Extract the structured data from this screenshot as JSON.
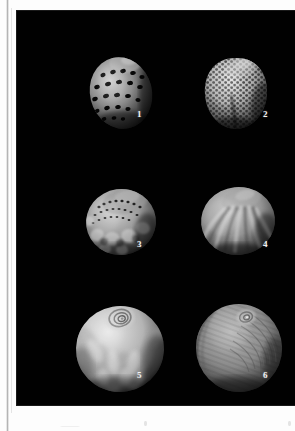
{
  "plate": {
    "background_color": "#010101",
    "page_color": "#fdfdfd",
    "label_color": "#f2f2f2",
    "columns": 2,
    "rows": 3,
    "specimen_count": 6,
    "figure_labels": [
      "1",
      "2",
      "3",
      "4",
      "5",
      "6"
    ],
    "specimens": [
      {
        "number": "1",
        "label": "1",
        "texture": "spotted-spiral-rows",
        "description": "Globular shell with dark sunken pits arranged in spiral rows",
        "relative_size": "small",
        "tone": "mid-gray",
        "cx": 104,
        "cy": 82,
        "rx": 31,
        "ry": 36,
        "label_x": 120,
        "label_y": 106
      },
      {
        "number": "2",
        "label": "2",
        "texture": "reticulate-honeycomb",
        "description": "Heart-shaped shell with dense honeycomb reticulate ornament",
        "relative_size": "small",
        "tone": "light-gray",
        "cx": 219,
        "cy": 82,
        "rx": 31,
        "ry": 35,
        "label_x": 246,
        "label_y": 106
      },
      {
        "number": "3",
        "label": "3",
        "texture": "mottled-sutural",
        "description": "Shell with mottled patches and beaded sutural ornament",
        "relative_size": "medium",
        "tone": "mid-gray",
        "cx": 104,
        "cy": 211,
        "rx": 35,
        "ry": 33,
        "label_x": 120,
        "label_y": 236
      },
      {
        "number": "4",
        "label": "4",
        "texture": "radial-ribs",
        "description": "Smooth shell with broad radial ribs and pale streaks",
        "relative_size": "medium",
        "tone": "mid-gray",
        "cx": 221,
        "cy": 210,
        "rx": 37,
        "ry": 34,
        "label_x": 246,
        "label_y": 236
      },
      {
        "number": "5",
        "label": "5",
        "texture": "flame-mottled-spire",
        "description": "Large smooth globular shell with spiral apex and flame-like mottling",
        "relative_size": "large",
        "tone": "light-gray",
        "cx": 103,
        "cy": 338,
        "rx": 44,
        "ry": 43,
        "label_x": 120,
        "label_y": 368
      },
      {
        "number": "6",
        "label": "6",
        "texture": "fine-growth-lines",
        "description": "Large shell with fine concentric growth lines and small raised apex",
        "relative_size": "large",
        "tone": "dark-gray",
        "cx": 222,
        "cy": 337,
        "rx": 43,
        "ry": 44,
        "label_x": 246,
        "label_y": 368
      }
    ]
  },
  "margin": {
    "gutter_present": true,
    "bottom_marks": [
      "",
      ""
    ]
  }
}
